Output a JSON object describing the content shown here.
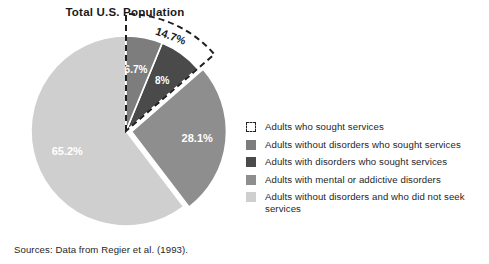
{
  "chart_data": {
    "type": "pie",
    "title": "Total U.S. Population",
    "xlabel": "",
    "ylabel": "",
    "legend_position": "right",
    "grid": false,
    "categories": [
      "Adults without disorders who sought services",
      "Adults with disorders who sought services",
      "Adults with mental or addictive disorders",
      "Adults without disorders and who did not seek services"
    ],
    "values": [
      6.7,
      8.0,
      28.1,
      65.2
    ],
    "value_labels": [
      "6.7%",
      "8%",
      "28.1%",
      "65.2%"
    ],
    "colors": [
      "#7d7d7d",
      "#4a4a4a",
      "#8e8e8e",
      "#cfcfcf"
    ],
    "annotations": [
      {
        "label": "14.7%",
        "description": "Adults who sought services",
        "value": 14.7,
        "style": "dashed-outline",
        "spans": [
          "Adults without disorders who sought services",
          "Adults with disorders who sought services"
        ]
      }
    ],
    "exploded_slices": [
      "Adults with mental or addictive disorders"
    ]
  },
  "legend": {
    "items": [
      {
        "label": "Adults who sought services",
        "swatch": "dashed-outline-swatch",
        "color": "#ffffff"
      },
      {
        "label": "Adults without disorders who sought services",
        "swatch": "solid-swatch",
        "color": "#7d7d7d"
      },
      {
        "label": "Adults with disorders who sought services",
        "swatch": "solid-swatch",
        "color": "#4a4a4a"
      },
      {
        "label": "Adults with mental or addictive disorders",
        "swatch": "solid-swatch",
        "color": "#8e8e8e"
      },
      {
        "label": "Adults without disorders and who did not seek services",
        "swatch": "solid-swatch",
        "color": "#cfcfcf"
      }
    ]
  },
  "source": {
    "text": "Sources: Data from Regier et al. (1993)."
  }
}
